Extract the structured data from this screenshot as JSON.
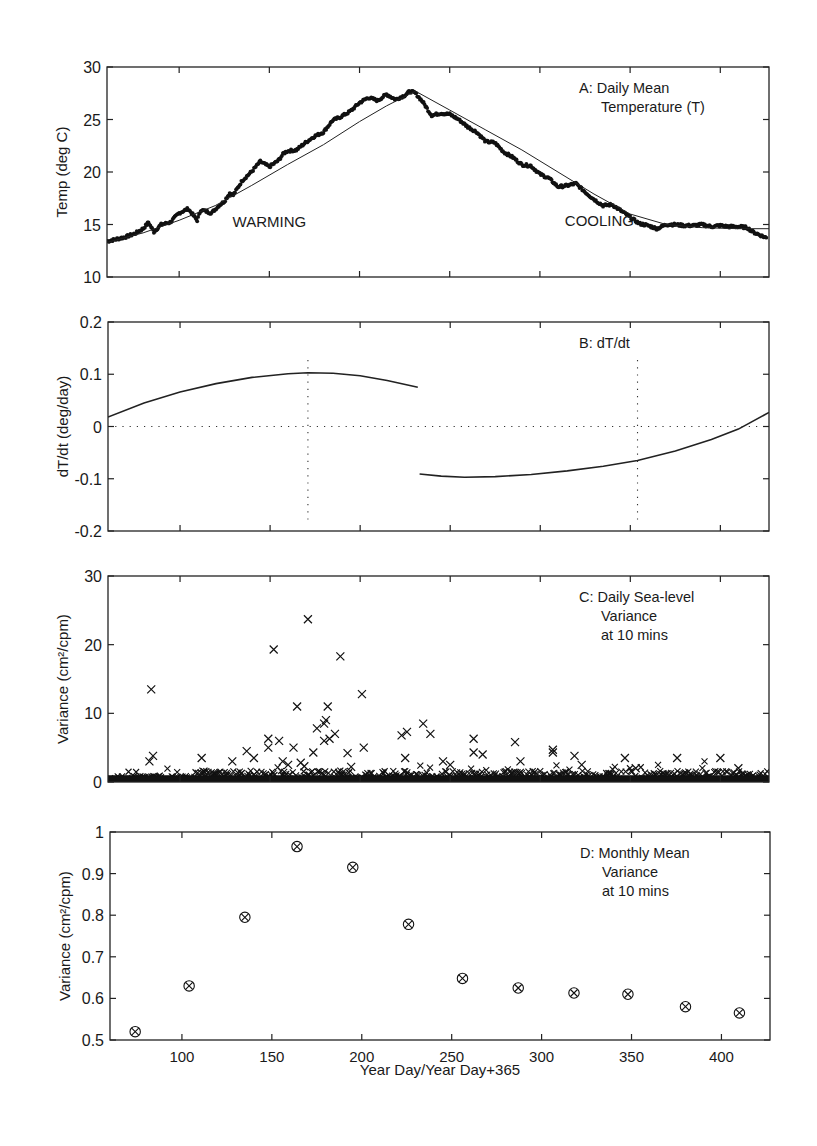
{
  "figure": {
    "xaxis_label": "Year Day/Year Day+365",
    "xticks": [
      100,
      150,
      200,
      250,
      300,
      350,
      400
    ],
    "xlim": [
      60,
      427
    ]
  },
  "chart_data": [
    {
      "id": "A",
      "type": "scatter",
      "title": "A:  Daily Mean Temperature (T)",
      "title_lines": [
        "A:  Daily Mean",
        "Temperature (T)"
      ],
      "xlabel": "",
      "ylabel": "Temp (deg C)",
      "ylim": [
        10,
        30
      ],
      "yticks": [
        10,
        15,
        20,
        25,
        30
      ],
      "grid": false,
      "annotations": [
        {
          "text": "WARMING",
          "x": 150,
          "y": 14.8
        },
        {
          "text": "COOLING",
          "x": 333,
          "y": 14.9
        }
      ],
      "series": [
        {
          "name": "daily mean (dots)",
          "style": "dots",
          "x": [
            60,
            65,
            70,
            75,
            80,
            83,
            86,
            90,
            95,
            100,
            105,
            110,
            112,
            118,
            122,
            125,
            128,
            130,
            135,
            140,
            145,
            150,
            155,
            158,
            160,
            165,
            170,
            175,
            180,
            185,
            190,
            195,
            200,
            205,
            210,
            215,
            220,
            225,
            228,
            231,
            235,
            238,
            240,
            245,
            250,
            255,
            260,
            265,
            270,
            275,
            280,
            285,
            290,
            295,
            300,
            305,
            310,
            315,
            320,
            325,
            330,
            335,
            340,
            345,
            350,
            355,
            360,
            365,
            370,
            375,
            380,
            385,
            390,
            395,
            400,
            405,
            410,
            415,
            418,
            422,
            426
          ],
          "y": [
            13.4,
            13.6,
            13.8,
            14.1,
            14.6,
            15.2,
            14.3,
            15.0,
            15.2,
            16.1,
            16.5,
            15.4,
            16.4,
            16.1,
            16.8,
            17.2,
            18.0,
            17.8,
            19.2,
            20.0,
            21.0,
            20.5,
            21.1,
            21.8,
            22.0,
            22.1,
            22.8,
            23.4,
            23.8,
            24.9,
            25.3,
            25.8,
            26.6,
            27.1,
            26.8,
            27.4,
            26.9,
            27.3,
            27.7,
            27.5,
            26.7,
            25.9,
            25.4,
            25.6,
            25.5,
            25.0,
            24.3,
            23.8,
            22.9,
            22.8,
            21.9,
            21.4,
            20.7,
            20.6,
            19.8,
            19.4,
            18.6,
            18.7,
            18.9,
            18.1,
            17.4,
            16.8,
            16.9,
            16.3,
            15.7,
            15.1,
            14.9,
            14.6,
            15.0,
            15.0,
            14.9,
            14.9,
            15.0,
            14.8,
            14.9,
            14.8,
            14.8,
            14.7,
            14.3,
            14.0,
            13.7
          ]
        },
        {
          "name": "fit (thin line)",
          "style": "line",
          "x": [
            60,
            80,
            100,
            120,
            140,
            160,
            180,
            200,
            215,
            231,
            250,
            270,
            290,
            310,
            330,
            350,
            370,
            390,
            410,
            427
          ],
          "y": [
            13.3,
            14.2,
            15.4,
            16.8,
            18.7,
            20.7,
            22.6,
            24.8,
            26.3,
            27.7,
            25.9,
            24.0,
            22.1,
            20.0,
            17.9,
            16.0,
            15.0,
            14.7,
            14.6,
            14.6
          ]
        }
      ]
    },
    {
      "id": "B",
      "type": "line",
      "title": "B:  dT/dt",
      "xlabel": "",
      "ylabel": "dT/dt (deg/day)",
      "ylim": [
        -0.2,
        0.2
      ],
      "yticks": [
        -0.2,
        -0.1,
        0,
        0.1,
        0.2
      ],
      "ytick_labels": [
        "-0.2",
        "-0.1",
        "0",
        "0.1",
        "0.2"
      ],
      "grid": false,
      "reference_lines": [
        {
          "orientation": "horizontal",
          "value": 0,
          "style": "dotted"
        },
        {
          "orientation": "vertical",
          "value": 171,
          "style": "dotted"
        },
        {
          "orientation": "vertical",
          "value": 354,
          "style": "dotted"
        }
      ],
      "series": [
        {
          "name": "warming dT/dt",
          "x": [
            60,
            80,
            100,
            120,
            140,
            160,
            171,
            185,
            200,
            215,
            232
          ],
          "y": [
            0.018,
            0.045,
            0.066,
            0.082,
            0.094,
            0.101,
            0.103,
            0.102,
            0.097,
            0.088,
            0.075
          ]
        },
        {
          "name": "cooling dT/dt",
          "x": [
            233,
            245,
            258,
            275,
            295,
            315,
            335,
            354,
            375,
            395,
            410,
            427
          ],
          "y": [
            -0.091,
            -0.095,
            -0.097,
            -0.096,
            -0.092,
            -0.085,
            -0.076,
            -0.065,
            -0.047,
            -0.025,
            -0.005,
            0.027
          ]
        }
      ]
    },
    {
      "id": "C",
      "type": "scatter",
      "title": "C:  Daily Sea-level Variance at 10 mins",
      "title_lines": [
        "C:  Daily Sea-level",
        "Variance",
        "at 10 mins"
      ],
      "xlabel": "",
      "ylabel": "Variance (cm²/cpm)",
      "ylim": [
        0,
        30
      ],
      "yticks": [
        0,
        10,
        20,
        30
      ],
      "grid": false,
      "marker": "x",
      "series": [
        {
          "name": "daily variance (outliers)",
          "x": [
            84,
            83,
            85,
            112,
            113,
            129,
            137,
            141,
            149,
            149,
            152,
            155,
            157,
            160,
            163,
            165,
            167,
            169,
            171,
            174,
            176,
            180,
            180,
            181,
            182,
            183,
            186,
            189,
            193,
            195,
            201,
            202,
            223,
            225,
            226,
            235,
            239,
            246,
            250,
            263,
            263,
            268,
            286,
            289,
            307,
            307,
            319,
            323,
            347,
            353,
            376,
            400,
            410
          ],
          "y": [
            13.5,
            3.0,
            3.8,
            3.5,
            1.5,
            3.0,
            4.5,
            3.5,
            6.3,
            5.0,
            19.3,
            6.0,
            3.0,
            2.5,
            5.0,
            11.0,
            2.8,
            2.3,
            23.7,
            4.3,
            7.8,
            6.0,
            8.5,
            9.0,
            11.0,
            6.3,
            7.0,
            18.3,
            4.2,
            2.2,
            12.8,
            5.0,
            6.8,
            3.5,
            7.3,
            8.5,
            7.0,
            3.0,
            2.5,
            6.3,
            4.3,
            4.0,
            5.8,
            3.0,
            4.3,
            4.7,
            3.8,
            2.5,
            3.5,
            2.0,
            3.5,
            3.5,
            2.0
          ]
        }
      ],
      "baseline_band": {
        "from_x": 60,
        "to_x": 427,
        "typical_range": [
          0,
          2
        ]
      }
    },
    {
      "id": "D",
      "type": "scatter",
      "title": "D:  Monthly Mean Variance at 10 mins",
      "title_lines": [
        "D:  Monthly Mean",
        "Variance",
        "at 10 mins"
      ],
      "xlabel": "Year Day/Year Day+365",
      "ylabel": "Variance (cm²/cpm)",
      "ylim": [
        0.5,
        1.0
      ],
      "yticks": [
        0.5,
        0.6,
        0.7,
        0.8,
        0.9,
        1.0
      ],
      "ytick_labels": [
        "0.5",
        "0.6",
        "0.7",
        "0.8",
        "0.9",
        "1"
      ],
      "grid": false,
      "marker": "circle-x",
      "series": [
        {
          "name": "monthly mean variance",
          "x": [
            74,
            104,
            135,
            164,
            195,
            226,
            256,
            287,
            318,
            348,
            380,
            410
          ],
          "y": [
            0.52,
            0.63,
            0.795,
            0.965,
            0.915,
            0.778,
            0.648,
            0.625,
            0.613,
            0.61,
            0.58,
            0.565
          ]
        }
      ]
    }
  ]
}
